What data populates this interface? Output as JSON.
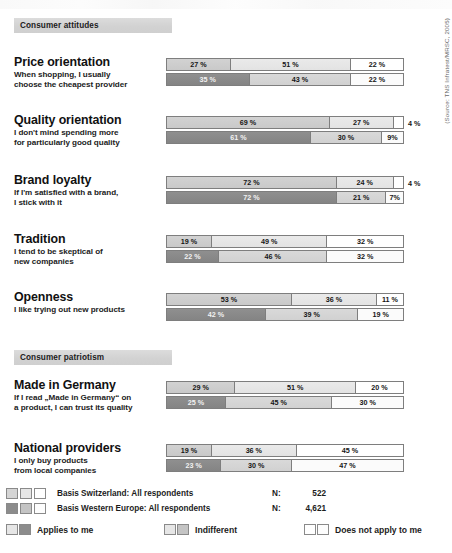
{
  "source_note": "(Source: TNS Infratest/MRSC, 2005)",
  "sections": [
    {
      "header": "Consumer attitudes",
      "items": [
        {
          "title": "Price orientation",
          "subtitle": "When shopping, I usually\nchoose the cheapest provider",
          "series_a": [
            27,
            51,
            22
          ],
          "series_b": [
            35,
            43,
            22
          ],
          "labels_a": [
            "27 %",
            "51 %",
            "22 %"
          ],
          "labels_b": [
            "35 %",
            "43 %",
            "22 %"
          ],
          "outside_a": "",
          "outside_b": ""
        },
        {
          "title": "Quality orientation",
          "subtitle": "I don't mind spending more\nfor particularly good quality",
          "series_a": [
            69,
            27,
            4
          ],
          "series_b": [
            61,
            30,
            9
          ],
          "labels_a": [
            "69 %",
            "27 %",
            ""
          ],
          "labels_b": [
            "61 %",
            "30 %",
            "9%"
          ],
          "outside_a": "4 %",
          "outside_b": ""
        },
        {
          "title": "Brand loyalty",
          "subtitle": "If I'm satisfied with a brand,\nI stick with it",
          "series_a": [
            72,
            24,
            4
          ],
          "series_b": [
            72,
            21,
            7
          ],
          "labels_a": [
            "72 %",
            "24 %",
            ""
          ],
          "labels_b": [
            "72 %",
            "21 %",
            "7%"
          ],
          "outside_a": "4 %",
          "outside_b": ""
        },
        {
          "title": "Tradition",
          "subtitle": "I tend to be skeptical of\nnew companies",
          "series_a": [
            19,
            49,
            32
          ],
          "series_b": [
            22,
            46,
            32
          ],
          "labels_a": [
            "19 %",
            "49 %",
            "32 %"
          ],
          "labels_b": [
            "22 %",
            "46 %",
            "32 %"
          ],
          "outside_a": "",
          "outside_b": ""
        },
        {
          "title": "Openness",
          "subtitle": "I like trying out new products",
          "series_a": [
            53,
            36,
            11
          ],
          "series_b": [
            42,
            39,
            19
          ],
          "labels_a": [
            "53 %",
            "36 %",
            "11 %"
          ],
          "labels_b": [
            "42 %",
            "39 %",
            "19 %"
          ],
          "outside_a": "",
          "outside_b": ""
        }
      ]
    },
    {
      "header": "Consumer patriotism",
      "items": [
        {
          "title": "Made in Germany",
          "subtitle": "If I read „Made in Germany“ on\na product, I can trust its quality",
          "series_a": [
            29,
            51,
            20
          ],
          "series_b": [
            25,
            45,
            30
          ],
          "labels_a": [
            "29 %",
            "51 %",
            "20 %"
          ],
          "labels_b": [
            "25 %",
            "45 %",
            "30 %"
          ],
          "outside_a": "",
          "outside_b": ""
        },
        {
          "title": "National providers",
          "subtitle": "I only buy products\nfrom local companies",
          "series_a": [
            19,
            36,
            45
          ],
          "series_b": [
            23,
            30,
            47
          ],
          "labels_a": [
            "19 %",
            "36 %",
            "45 %"
          ],
          "labels_b": [
            "23 %",
            "30 %",
            "47 %"
          ],
          "outside_a": "",
          "outside_b": ""
        }
      ]
    }
  ],
  "legend": {
    "basis": [
      {
        "text": "Basis Switzerland: All respondents",
        "n_label": "N:",
        "n_value": "522"
      },
      {
        "text": "Basis Western Europe: All respondents",
        "n_label": "N:",
        "n_value": "4,621"
      }
    ],
    "keys": [
      {
        "label": "Applies to me"
      },
      {
        "label": "Indifferent"
      },
      {
        "label": "Does not apply to me"
      }
    ]
  },
  "chart_data": {
    "type": "bar",
    "orientation": "horizontal",
    "stacked": true,
    "unit": "percent",
    "xlim": [
      0,
      100
    ],
    "grid": false,
    "legend_position": "bottom",
    "categories": [
      "Price orientation",
      "Quality orientation",
      "Brand loyalty",
      "Tradition",
      "Openness",
      "Made in Germany",
      "National providers"
    ],
    "stack_levels": [
      "Applies to me",
      "Indifferent",
      "Does not apply to me"
    ],
    "series": [
      {
        "name": "Basis Switzerland: All respondents",
        "n": 522,
        "values": [
          [
            27,
            51,
            22
          ],
          [
            69,
            27,
            4
          ],
          [
            72,
            24,
            4
          ],
          [
            19,
            49,
            32
          ],
          [
            53,
            36,
            11
          ],
          [
            29,
            51,
            20
          ],
          [
            19,
            36,
            45
          ]
        ]
      },
      {
        "name": "Basis Western Europe: All respondents",
        "n": 4621,
        "values": [
          [
            35,
            43,
            22
          ],
          [
            61,
            30,
            9
          ],
          [
            72,
            21,
            7
          ],
          [
            22,
            46,
            32
          ],
          [
            42,
            39,
            19
          ],
          [
            25,
            45,
            30
          ],
          [
            23,
            30,
            47
          ]
        ]
      }
    ],
    "annotations": [
      "(Source: TNS Infratest/MRSC, 2005)"
    ],
    "colors": {
      "applies_a": "#cdcdcd",
      "applies_b": "#8a8a8a",
      "indifferent_a": "#e6e6e6",
      "indifferent_b": "#d5d5d5",
      "not_apply_a": "#ffffff",
      "not_apply_b": "#fbfbfb",
      "section_band": "#d4d4d4"
    }
  }
}
